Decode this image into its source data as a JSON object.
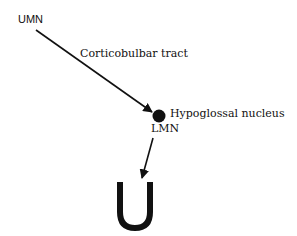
{
  "diagram": {
    "labels": {
      "umn": "UMN",
      "tract": "Corticobulbar tract",
      "nucleus": "Hypoglossal nucleus",
      "lmn": "LMN"
    },
    "colors": {
      "ink": "#111111",
      "background": "#ffffff"
    },
    "shapes": {
      "nucleus_dot": "filled-circle",
      "tongue_symbol": "U-shape"
    }
  }
}
